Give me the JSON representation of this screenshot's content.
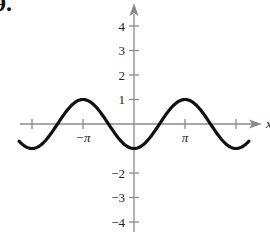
{
  "figure": {
    "problem_number": "9.",
    "x_axis_label": "x",
    "y_axis_label": "y"
  },
  "chart_data": {
    "type": "line",
    "title": "",
    "function": "y = -cos(x)",
    "xlabel": "x",
    "ylabel": "y",
    "xlim": [
      -2.3,
      2.3
    ],
    "xlim_units": "multiples of pi",
    "ylim": [
      -4.5,
      4.5
    ],
    "grid": false,
    "legend": null,
    "x_ticks": [
      {
        "value": -2,
        "label": ""
      },
      {
        "value": -1,
        "label": "−π"
      },
      {
        "value": 1,
        "label": "π"
      },
      {
        "value": 2,
        "label": ""
      }
    ],
    "y_ticks": [
      {
        "value": 4,
        "label": "4"
      },
      {
        "value": 3,
        "label": "3"
      },
      {
        "value": 2,
        "label": "2"
      },
      {
        "value": 1,
        "label": "1"
      },
      {
        "value": -2,
        "label": "−2"
      },
      {
        "value": -3,
        "label": "−3"
      },
      {
        "value": -4,
        "label": "−4"
      }
    ],
    "series": [
      {
        "name": "y = -cos x",
        "x_pi": [
          -2.25,
          -2,
          -1.5,
          -1,
          -0.5,
          0,
          0.5,
          1,
          1.5,
          2,
          2.25
        ],
        "y": [
          -0.71,
          -1,
          0,
          1,
          0,
          -1,
          0,
          1,
          0,
          -1,
          -0.71
        ]
      }
    ]
  }
}
